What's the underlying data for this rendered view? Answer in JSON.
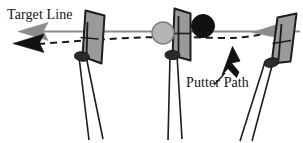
{
  "figure": {
    "background_color": "#ffffff",
    "width": 303,
    "height": 143
  },
  "labels": {
    "target_line": "Target Line",
    "putter_path": "Putter Path"
  },
  "colors": {
    "target_line_stroke": "#8a8a8a",
    "target_arrow_fill": "#8c8c8c",
    "putter_path_stroke": "#1a1a1a",
    "putter_path_arrow_fill": "#111111",
    "putter_head_fill": "#9a9a9a",
    "putter_head_stroke": "#1c1c1c",
    "hosel_fill": "#2b2b2b",
    "shaft_stroke": "#1c1c1c",
    "ball_gray_fill": "#b5b5b5",
    "ball_black_fill": "#111111",
    "text_fill": "#141414"
  },
  "elements": {
    "target_line": {
      "name": "target-line",
      "style": "solid",
      "description": "straight horizontal gray line with left-pointing arrowhead"
    },
    "putter_path_line": {
      "name": "putter-path-line",
      "style": "dashed",
      "description": "curved dashed black arc crossing the target line, arrowhead at left"
    },
    "putters": [
      {
        "position": "backswing-left",
        "label": "putter-left"
      },
      {
        "position": "impact-center",
        "label": "putter-center"
      },
      {
        "position": "follow-through-right",
        "label": "putter-right"
      }
    ],
    "balls": [
      {
        "name": "golf-ball-gray",
        "fill": "#b5b5b5"
      },
      {
        "name": "golf-ball-black",
        "fill": "#111111"
      }
    ],
    "arrows": [
      {
        "name": "target-line-arrow-left",
        "color": "#8c8c8c",
        "direction": "left"
      },
      {
        "name": "putter-path-arrow-left",
        "color": "#111111",
        "direction": "left"
      },
      {
        "name": "target-line-arrow-right",
        "color": "#8c8c8c",
        "direction": "left"
      },
      {
        "name": "putter-path-callout-arrow",
        "color": "#111111",
        "direction": "up-right"
      }
    ]
  }
}
